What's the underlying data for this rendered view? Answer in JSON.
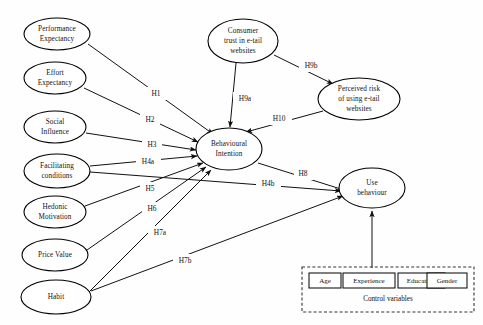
{
  "diagram": {
    "type": "conceptual-research-model",
    "background_color": "#ffffff",
    "line_color": "#111111",
    "nodes": [
      {
        "id": "performance_expectancy",
        "label_line1": "Performance",
        "label_line2": "Expectancy",
        "shape": "ellipse",
        "cx": 57,
        "cy": 34,
        "rx": 33,
        "ry": 16
      },
      {
        "id": "effort_expectancy",
        "label_line1": "Effort",
        "label_line2": "Expectancy",
        "shape": "ellipse",
        "cx": 55,
        "cy": 78,
        "rx": 31,
        "ry": 16
      },
      {
        "id": "social_influence",
        "label_line1": "Social",
        "label_line2": "Influence",
        "shape": "ellipse",
        "cx": 55,
        "cy": 127,
        "rx": 31,
        "ry": 16
      },
      {
        "id": "facilitating_conditions",
        "label_line1": "Facilitating",
        "label_line2": "conditions",
        "shape": "ellipse",
        "cx": 57,
        "cy": 171,
        "rx": 33,
        "ry": 17
      },
      {
        "id": "hedonic_motivation",
        "label_line1": "Hedonic",
        "label_line2": "Motivation",
        "shape": "ellipse",
        "cx": 55,
        "cy": 212,
        "rx": 31,
        "ry": 16
      },
      {
        "id": "price_value",
        "label_line1": "Price Value",
        "label_line2": "",
        "shape": "ellipse",
        "cx": 55,
        "cy": 255,
        "rx": 33,
        "ry": 16
      },
      {
        "id": "habit",
        "label_line1": "Habit",
        "label_line2": "",
        "shape": "ellipse",
        "cx": 56,
        "cy": 297,
        "rx": 35,
        "ry": 17
      },
      {
        "id": "consumer_trust",
        "label_line1": "Consumer",
        "label_line2": "trust in e-tail",
        "label_line3": "websites",
        "shape": "ellipse",
        "cx": 243,
        "cy": 41,
        "rx": 35,
        "ry": 22
      },
      {
        "id": "perceived_risk",
        "label_line1": "Perceived risk",
        "label_line2": "of using e-tail",
        "label_line3": "websites",
        "shape": "ellipse",
        "cx": 359,
        "cy": 99,
        "rx": 41,
        "ry": 21
      },
      {
        "id": "behavioural_intention",
        "label_line1": "Behavioural",
        "label_line2": "Intention",
        "shape": "ellipse",
        "cx": 229,
        "cy": 149,
        "rx": 33,
        "ry": 21
      },
      {
        "id": "use_behaviour",
        "label_line1": "Use",
        "label_line2": "behaviour",
        "shape": "ellipse",
        "cx": 372,
        "cy": 188,
        "rx": 33,
        "ry": 20
      }
    ],
    "hypotheses": [
      {
        "id": "h1",
        "label": "H1",
        "from": "performance_expectancy",
        "to": "behavioural_intention",
        "label_x": 156,
        "label_y": 94
      },
      {
        "id": "h2",
        "label": "H2",
        "from": "effort_expectancy",
        "to": "behavioural_intention",
        "label_x": 150,
        "label_y": 120
      },
      {
        "id": "h3",
        "label": "H3",
        "from": "social_influence",
        "to": "behavioural_intention",
        "label_x": 152,
        "label_y": 145
      },
      {
        "id": "h4a",
        "label": "H4a",
        "from": "facilitating_conditions",
        "to": "behavioural_intention",
        "label_x": 148,
        "label_y": 162
      },
      {
        "id": "h4b",
        "label": "H4b",
        "from": "facilitating_conditions",
        "to": "use_behaviour",
        "label_x": 268,
        "label_y": 184
      },
      {
        "id": "h5",
        "label": "H5",
        "from": "hedonic_motivation",
        "to": "behavioural_intention",
        "label_x": 150,
        "label_y": 189
      },
      {
        "id": "h6",
        "label": "H6",
        "from": "price_value",
        "to": "behavioural_intention",
        "label_x": 152,
        "label_y": 209
      },
      {
        "id": "h7a",
        "label": "H7a",
        "from": "habit",
        "to": "behavioural_intention",
        "label_x": 160,
        "label_y": 233
      },
      {
        "id": "h7b",
        "label": "H7b",
        "from": "habit",
        "to": "use_behaviour",
        "label_x": 185,
        "label_y": 261
      },
      {
        "id": "h8",
        "label": "H8",
        "from": "behavioural_intention",
        "to": "use_behaviour",
        "label_x": 303,
        "label_y": 174
      },
      {
        "id": "h9a",
        "label": "H9a",
        "from": "consumer_trust",
        "to": "behavioural_intention",
        "label_x": 245,
        "label_y": 99
      },
      {
        "id": "h9b",
        "label": "H9b",
        "from": "consumer_trust",
        "to": "perceived_risk",
        "label_x": 311,
        "label_y": 66
      },
      {
        "id": "h10",
        "label": "H10",
        "from": "perceived_risk",
        "to": "behavioural_intention",
        "label_x": 279,
        "label_y": 119
      }
    ],
    "control_variables": {
      "caption": "Control variables",
      "items": [
        "Age",
        "Experience",
        "Education",
        "Gender"
      ],
      "target": "use_behaviour",
      "border_style": "dashed"
    }
  }
}
